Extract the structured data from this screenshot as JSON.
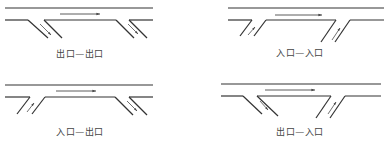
{
  "figure": {
    "background": "#ffffff",
    "line_color": "#333333",
    "arrow_color": "#444444",
    "panels": [
      {
        "id": "exit-exit",
        "label": "出口—出口",
        "label_pos": [
          80,
          53
        ],
        "main_top": {
          "y": 8,
          "x1": 5,
          "x2": 153
        },
        "main_bottom_y": 20,
        "ramps": [
          {
            "type": "exit",
            "direction": "down-right",
            "outer": [
              [
                28,
                20
              ],
              [
                48,
                38
              ]
            ],
            "inner": [
              [
                44,
                20
              ],
              [
                62,
                38
              ]
            ],
            "arrow": [
              [
                40,
                24
              ],
              [
                51,
                35
              ]
            ]
          },
          {
            "type": "exit",
            "direction": "down-right",
            "outer": [
              [
                116,
                20
              ],
              [
                134,
                38
              ]
            ],
            "inner": [
              [
                129,
                20
              ],
              [
                147,
                38
              ]
            ],
            "arrow": [
              [
                128,
                24
              ],
              [
                138,
                34
              ]
            ]
          }
        ],
        "flow_arrow": {
          "y": 14,
          "x1": 60,
          "x2": 100
        }
      },
      {
        "id": "entrance-entrance",
        "label": "入口—入口",
        "label_pos": [
          300,
          52
        ],
        "main_top": {
          "y": 8,
          "x1": 228,
          "x2": 384
        },
        "main_bottom_y": 20,
        "ramps": [
          {
            "type": "entrance",
            "direction": "up-right",
            "outer": [
              [
                252,
                20
              ],
              [
                240,
                36
              ]
            ],
            "inner": [
              [
                266,
                20
              ],
              [
                254,
                36
              ]
            ],
            "arrow": [
              [
                248,
                35
              ],
              [
                255,
                27
              ]
            ]
          },
          {
            "type": "entrance",
            "direction": "up-right",
            "outer": [
              [
                336,
                20
              ],
              [
                321,
                42
              ]
            ],
            "inner": [
              [
                350,
                20
              ],
              [
                335,
                42
              ]
            ],
            "arrow": [
              [
                332,
                40
              ],
              [
                340,
                28
              ]
            ]
          }
        ],
        "flow_arrow": {
          "y": 15,
          "x1": 275,
          "x2": 322
        }
      },
      {
        "id": "entrance-exit",
        "label": "入口—出口",
        "label_pos": [
          80,
          131
        ],
        "main_top": {
          "y": 85,
          "x1": 5,
          "x2": 153
        },
        "main_bottom_y": 97,
        "ramps": [
          {
            "type": "entrance",
            "direction": "up-right",
            "outer": [
              [
                30,
                97
              ],
              [
                17,
                114
              ]
            ],
            "inner": [
              [
                45,
                97
              ],
              [
                32,
                114
              ]
            ],
            "arrow": [
              [
                27,
                112
              ],
              [
                34,
                103
              ]
            ]
          },
          {
            "type": "exit",
            "direction": "down-right",
            "outer": [
              [
                115,
                97
              ],
              [
                133,
                115
              ]
            ],
            "inner": [
              [
                129,
                97
              ],
              [
                147,
                115
              ]
            ],
            "arrow": [
              [
                127,
                101
              ],
              [
                137,
                111
              ]
            ]
          }
        ],
        "flow_arrow": {
          "y": 91,
          "x1": 56,
          "x2": 96
        }
      },
      {
        "id": "exit-entrance",
        "label": "出口—入口",
        "label_pos": [
          300,
          131
        ],
        "main_top": {
          "y": 84,
          "x1": 221,
          "x2": 381
        },
        "main_bottom_y": 96,
        "ramps": [
          {
            "type": "exit",
            "direction": "down-right",
            "outer": [
              [
                243,
                96
              ],
              [
                262,
                114
              ]
            ],
            "inner": [
              [
                257,
                96
              ],
              [
                278,
                116
              ]
            ],
            "arrow": [
              [
                260,
                101
              ],
              [
                268,
                110
              ]
            ]
          },
          {
            "type": "entrance",
            "direction": "up-right",
            "outer": [
              [
                331,
                96
              ],
              [
                316,
                118
              ]
            ],
            "inner": [
              [
                345,
                96
              ],
              [
                330,
                118
              ]
            ],
            "arrow": [
              [
                328,
                114
              ],
              [
                336,
                102
              ]
            ]
          }
        ],
        "flow_arrow": {
          "y": 90,
          "x1": 265,
          "x2": 315
        }
      }
    ]
  }
}
